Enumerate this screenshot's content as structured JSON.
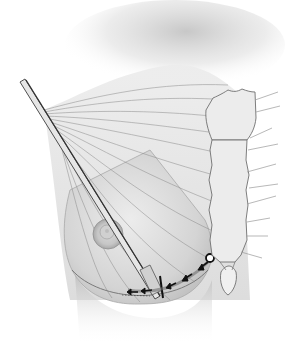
{
  "figure": {
    "colors": {
      "background": "#ffffff",
      "skin_light": "#e9e9e9",
      "skin_mid": "#cfcfcf",
      "shadow": "#9a9a9a",
      "line": "#6e6e6e",
      "instrument": "#555555",
      "marker": "#111111"
    },
    "parts": [
      "shoulder-shadow",
      "pectoral-fibers",
      "breast-mound",
      "areola",
      "instrument-rod",
      "inframammary-incision-arrows",
      "entry-point-marker",
      "sternum",
      "xiphoid-process",
      "ribs"
    ],
    "annotations": []
  }
}
